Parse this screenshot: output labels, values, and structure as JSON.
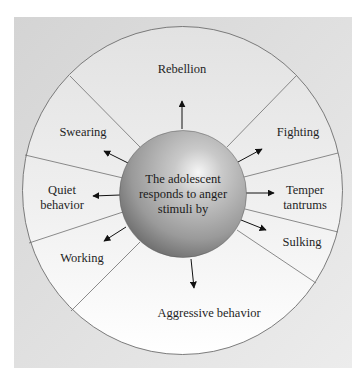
{
  "diagram": {
    "title": "",
    "center": {
      "lines": [
        "The adolescent",
        "responds to anger",
        "stimuli by"
      ]
    },
    "responses": [
      {
        "id": "rebellion",
        "lines": [
          "Rebellion"
        ],
        "x": 182,
        "y": 69
      },
      {
        "id": "fighting",
        "lines": [
          "Fighting"
        ],
        "x": 298,
        "y": 132
      },
      {
        "id": "temper-tantrums",
        "lines": [
          "Temper",
          "tantrums"
        ],
        "x": 305,
        "y": 198
      },
      {
        "id": "sulking",
        "lines": [
          "Sulking"
        ],
        "x": 302,
        "y": 242
      },
      {
        "id": "aggressive-behavior",
        "lines": [
          "Aggressive behavior"
        ],
        "x": 209,
        "y": 313
      },
      {
        "id": "working",
        "lines": [
          "Working"
        ],
        "x": 82,
        "y": 258
      },
      {
        "id": "quiet-behavior",
        "lines": [
          "Quiet",
          "behavior"
        ],
        "x": 62,
        "y": 198
      },
      {
        "id": "swearing",
        "lines": [
          "Swearing"
        ],
        "x": 83,
        "y": 132
      }
    ],
    "colors": {
      "frame": "#dcdcdc",
      "wheel_top": "#e4e4e4",
      "wheel_bottom": "#ffffff",
      "outline": "#6e6e6e",
      "sphere_light": "#f4f4f4",
      "sphere_mid": "#a8a8a8",
      "sphere_dark": "#5e5e5e",
      "text": "#1f1f1f",
      "arrow": "#111111"
    }
  }
}
